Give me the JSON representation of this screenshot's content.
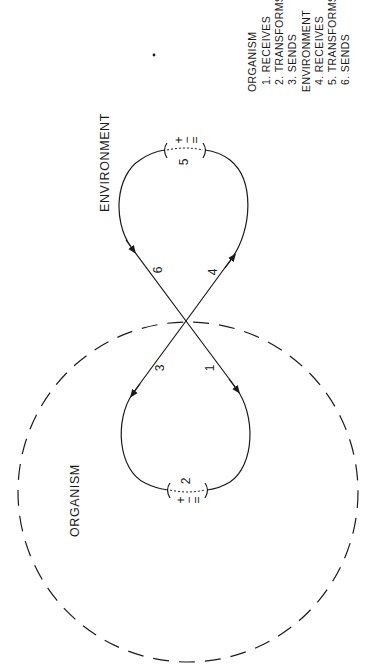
{
  "diagram": {
    "regions": {
      "organism_label": "ORGANISM",
      "environment_label": "ENVIRONMENT"
    },
    "step_numbers": {
      "s1": "1",
      "s2": "2",
      "s3": "3",
      "s4": "4",
      "s5": "5",
      "s6": "6"
    },
    "transform_symbol": {
      "top": "+",
      "middle": "−",
      "bottom": "="
    },
    "legend": {
      "organism_header": "ORGANISM",
      "organism_items": [
        "1. RECEIVES",
        "2. TRANSFORMS",
        "3. SENDS"
      ],
      "environment_header": "ENVIRONMENT",
      "environment_items": [
        "4. RECEIVES",
        "5. TRANSFORMS",
        "6. SENDS"
      ]
    },
    "colors": {
      "stroke": "#1a1a1a",
      "background": "#ffffff"
    }
  }
}
